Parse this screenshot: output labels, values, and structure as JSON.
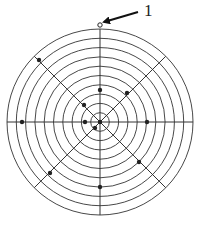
{
  "diagram": {
    "type": "concentric-ring-target",
    "center": {
      "x": 100,
      "y": 122
    },
    "ring_count": 10,
    "outer_radius": 93,
    "spoke_angles_deg": [
      0,
      45,
      90,
      135
    ],
    "stroke_color": "#333333",
    "dot_color": "#222222",
    "dots": [
      {
        "x": 100,
        "y": 25,
        "style": "hollow"
      },
      {
        "x": 39,
        "y": 60,
        "style": "filled"
      },
      {
        "x": 100,
        "y": 90,
        "style": "filled"
      },
      {
        "x": 127,
        "y": 93,
        "style": "filled"
      },
      {
        "x": 84,
        "y": 105,
        "style": "filled"
      },
      {
        "x": 22,
        "y": 122,
        "style": "filled"
      },
      {
        "x": 85,
        "y": 122,
        "style": "filled"
      },
      {
        "x": 100,
        "y": 122,
        "style": "filled"
      },
      {
        "x": 95,
        "y": 128,
        "style": "filled"
      },
      {
        "x": 147,
        "y": 122,
        "style": "filled"
      },
      {
        "x": 139,
        "y": 162,
        "style": "filled"
      },
      {
        "x": 50,
        "y": 173,
        "style": "filled"
      },
      {
        "x": 100,
        "y": 187,
        "style": "filled"
      }
    ],
    "callout": {
      "label": "1",
      "arrow_from": {
        "x": 138,
        "y": 12
      },
      "arrow_to": {
        "x": 104,
        "y": 22
      }
    }
  }
}
